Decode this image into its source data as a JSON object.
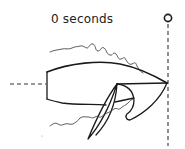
{
  "diagram": {
    "time_label": "0 seconds",
    "elements": [
      {
        "name": "time-label",
        "text": "0 seconds"
      },
      {
        "name": "reference-pin-marker",
        "shape": "circle"
      },
      {
        "name": "reference-line",
        "style": "dashed"
      },
      {
        "name": "axis-line",
        "style": "dashed"
      },
      {
        "name": "body-outline",
        "style": "hand-drawn"
      },
      {
        "name": "flap",
        "style": "hand-drawn"
      },
      {
        "name": "wake-upper",
        "style": "wavy"
      },
      {
        "name": "wake-lower",
        "style": "wavy"
      }
    ],
    "colors": {
      "ink": "#1a1a1a",
      "background": "#ffffff"
    }
  }
}
